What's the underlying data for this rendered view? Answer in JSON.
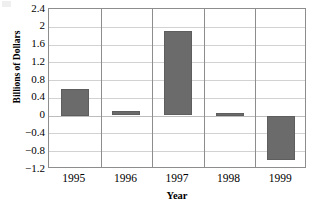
{
  "chart_data": {
    "type": "bar",
    "title": "",
    "subtitle": "",
    "xlabel": "Year",
    "ylabel": "Billions of Dollars",
    "categories": [
      "1995",
      "1996",
      "1997",
      "1998",
      "1999"
    ],
    "values": [
      0.6,
      0.1,
      1.9,
      0.07,
      -1.0
    ],
    "series": [
      {
        "name": "",
        "values": [
          0.6,
          0.1,
          1.9,
          0.07,
          -1.0
        ]
      }
    ],
    "ylim": [
      -1.2,
      2.4
    ],
    "y_ticks": [
      2.4,
      2,
      1.6,
      1.2,
      0.8,
      0.4,
      0,
      -0.4,
      -0.8,
      -1.2
    ],
    "y_tick_labels": [
      "2.4",
      "2",
      "1.6",
      "1.2",
      "0.8",
      "0.4",
      "0",
      "−0.4",
      "−0.8",
      "−1.2"
    ],
    "grid": {
      "horizontal": true,
      "vertical": true
    },
    "legend": {
      "visible": false,
      "position": "none",
      "entries": []
    },
    "annotations": [],
    "colors": {
      "bar_fill": "#6b6b6b",
      "bar_stroke": "#5e5e5e",
      "gridline": "#d2d2d2",
      "category_separator": "#8d8d8d",
      "frame": "#8d8d8d",
      "background": "#ffffff",
      "text": "#000000"
    }
  }
}
